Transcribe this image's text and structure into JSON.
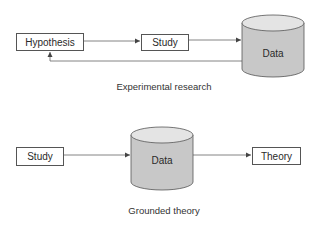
{
  "experimental": {
    "nodes": {
      "hypothesis": "Hypothesis",
      "study": "Study",
      "data": "Data"
    },
    "edges": [
      {
        "from": "Hypothesis",
        "to": "Study"
      },
      {
        "from": "Study",
        "to": "Data"
      },
      {
        "from": "Data",
        "to": "Hypothesis"
      }
    ],
    "caption": "Experimental research"
  },
  "grounded": {
    "nodes": {
      "study": "Study",
      "data": "Data",
      "theory": "Theory"
    },
    "edges": [
      {
        "from": "Study",
        "to": "Data"
      },
      {
        "from": "Data",
        "to": "Theory"
      }
    ],
    "caption": "Grounded theory"
  },
  "colors": {
    "cylinder_fill": "#c8c8c8",
    "cylinder_top": "#e4e4e4",
    "stroke": "#555555",
    "line": "#666666"
  }
}
